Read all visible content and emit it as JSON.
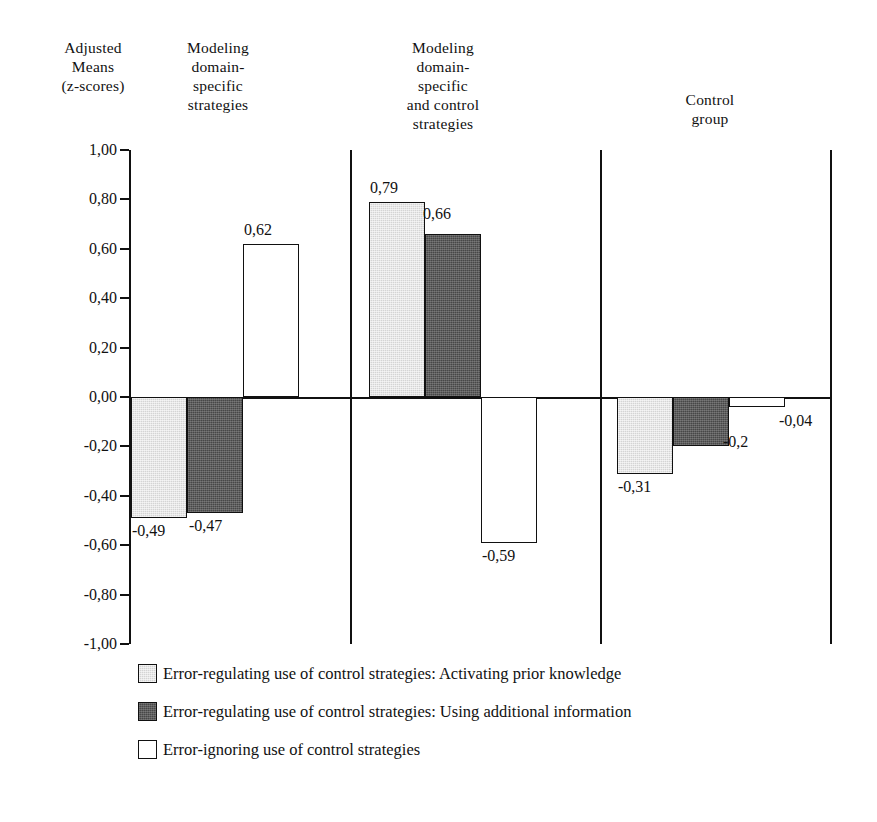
{
  "chart_data": {
    "type": "bar",
    "title": "",
    "ylabel": "Adjusted Means (z-scores)",
    "xlabel": "",
    "ylim": [
      -1.0,
      1.0
    ],
    "grid": false,
    "legend_position": "bottom-left",
    "decimal_separator": ",",
    "categories": [
      "Modeling domain-specific strategies",
      "Modeling domain-specific and control strategies",
      "Control group"
    ],
    "series": [
      {
        "name": "Error-regulating use of control strategies: Activating prior knowledge",
        "color": "#d4d4d4",
        "values": [
          -0.49,
          0.79,
          -0.31
        ],
        "labels": [
          "-0,49",
          "0,79",
          "-0,31"
        ]
      },
      {
        "name": "Error-regulating use of control strategies: Using additional information",
        "color": "#474747",
        "values": [
          -0.47,
          0.66,
          -0.2
        ],
        "labels": [
          "-0,47",
          "0,66",
          "-0,2"
        ]
      },
      {
        "name": "Error-ignoring use of control strategies",
        "color": "#ffffff",
        "values": [
          0.62,
          -0.59,
          -0.04
        ],
        "labels": [
          "0,62",
          "-0,59",
          "-0,04"
        ]
      }
    ],
    "yticks": [
      1.0,
      0.8,
      0.6,
      0.4,
      0.2,
      0.0,
      -0.2,
      -0.4,
      -0.6,
      -0.8,
      -1.0
    ],
    "ytick_labels": [
      "1,00",
      "0,80",
      "0,60",
      "0,40",
      "0,20",
      "0,00",
      "-0,20",
      "-0,40",
      "-0,60",
      "-0,80",
      "-1,00"
    ]
  },
  "axis_header": {
    "line1": "Adjusted",
    "line2": "Means",
    "line3": "(z-scores)",
    "text": "Adjusted\nMeans\n(z-scores)"
  },
  "group_headers": {
    "group1": "Modeling\ndomain-\nspecific\nstrategies",
    "group2": "Modeling\ndomain-\nspecific\nand control\nstrategies",
    "group3": "Control\ngroup"
  },
  "legend": {
    "items": [
      {
        "swatch": "light-gray",
        "label": "Error-regulating use of control strategies: Activating prior knowledge"
      },
      {
        "swatch": "dark-gray",
        "label": "Error-regulating use of control strategies: Using additional information"
      },
      {
        "swatch": "white",
        "label": "Error-ignoring use of control strategies"
      }
    ]
  },
  "colors": {
    "light_gray": "#d4d4d4",
    "dark_gray": "#474747",
    "white": "#ffffff",
    "axis": "#111111"
  }
}
